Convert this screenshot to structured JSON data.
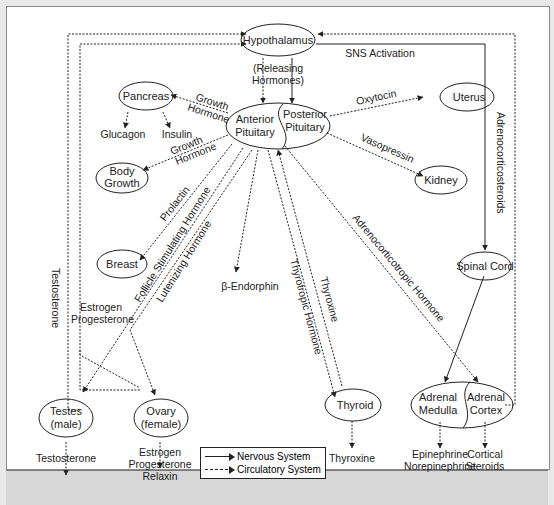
{
  "diagram": {
    "nodes": {
      "hypothalamus": "Hypothalamus",
      "anterior_pituitary": [
        "Anterior",
        "Pituitary"
      ],
      "posterior_pituitary": [
        "Posterior",
        "Pituitary"
      ],
      "pancreas": "Pancreas",
      "body_growth": [
        "Body",
        "Growth"
      ],
      "breast": "Breast",
      "uterus": "Uterus",
      "kidney": "Kidney",
      "spinal_cord": "Spinal Cord",
      "testes": [
        "Testes",
        "(male)"
      ],
      "ovary": [
        "Ovary",
        "(female)"
      ],
      "thyroid": "Thyroid",
      "adrenal_medulla": [
        "Adrenal",
        "Medulla"
      ],
      "adrenal_cortex": [
        "Adrenal",
        "Cortex"
      ]
    },
    "outputs": {
      "glucagon": "Glucagon",
      "insulin": "Insulin",
      "beta_endorphin": "β-Endorphin",
      "testosterone": "Testosterone",
      "ovary_outputs": [
        "Estrogen",
        "Progesterone",
        "Relaxin"
      ],
      "thyroxine": "Thyroxine",
      "medulla_outputs": [
        "Epinephrine",
        "Norepinephrine"
      ],
      "cortex_outputs": [
        "Cortical",
        "Steroids"
      ]
    },
    "edge_labels": {
      "releasing_hormones": [
        "(Releasing",
        "Hormones)"
      ],
      "sns_activation": "SNS Activation",
      "growth_hormone_pancreas": [
        "Growth",
        "Hormone"
      ],
      "growth_hormone_body": [
        "Growth",
        "Hormone"
      ],
      "oxytocin": "Oxytocin",
      "vasopressin": "Vasopressin",
      "prolactin": "Prolactin",
      "fsh": "Follicle Stimulating Hormone",
      "lh": "Lutenizing Hormone",
      "thyrotropic": "Thyrotropic Hormone",
      "thyroxine_feedback": "Thyroxine",
      "acth": "Adrenocorticotropic Hormone",
      "adrenocorticosteroids": "Adrenocorticosteroids",
      "testosterone_feedback": "Testosterone",
      "estrogen_progesterone_feedback": [
        "Estrogen",
        "Progesterone"
      ]
    },
    "legend": {
      "nervous": "Nervous System",
      "circulatory": "Circulatory System"
    }
  }
}
